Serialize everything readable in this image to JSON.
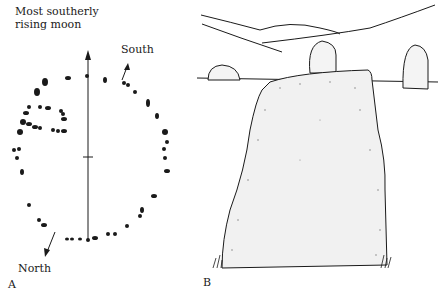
{
  "panel_a": {
    "label": "A",
    "annotation_moon_line1": "Most southerly",
    "annotation_moon_line2": "rising moon",
    "annotation_south": "South",
    "annotation_north": "North"
  },
  "panel_b": {
    "label": "B"
  },
  "colors": {
    "ink": "#1a1a1a",
    "background": "#ffffff"
  }
}
